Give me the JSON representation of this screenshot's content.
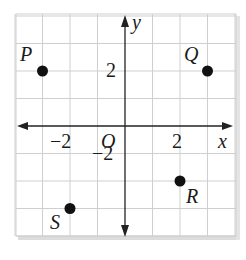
{
  "diagram": {
    "type": "coordinate-plane",
    "axes": {
      "x_label": "x",
      "y_label": "y",
      "origin_label": "O",
      "x_range": [
        -4,
        4
      ],
      "y_range": [
        -4,
        4
      ],
      "grid_step": 1
    },
    "tick_labels": {
      "x_neg": "−2",
      "x_pos": "2",
      "y_neg": "−2",
      "y_pos": "2"
    },
    "points": [
      {
        "label": "P",
        "x": -3,
        "y": 2
      },
      {
        "label": "Q",
        "x": 3,
        "y": 2
      },
      {
        "label": "R",
        "x": 2,
        "y": -2
      },
      {
        "label": "S",
        "x": -2,
        "y": -3
      }
    ],
    "colors": {
      "grid": "#cfcfcf",
      "axis": "#222222",
      "point": "#111111",
      "shadow": "#d9d9d9"
    }
  }
}
